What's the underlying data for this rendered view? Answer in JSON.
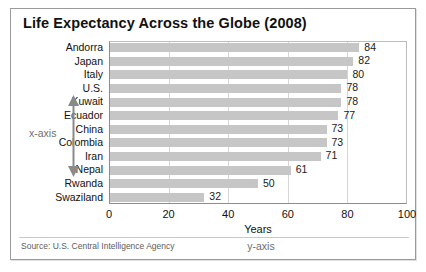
{
  "chart_data": {
    "type": "bar",
    "orientation": "horizontal",
    "title": "Life Expectancy Across the Globe (2008)",
    "categories": [
      "Andorra",
      "Japan",
      "Italy",
      "U.S.",
      "Kuwait",
      "Ecuador",
      "China",
      "Colombia",
      "Iran",
      "Nepal",
      "Rwanda",
      "Swaziland"
    ],
    "values": [
      84,
      82,
      80,
      78,
      78,
      77,
      73,
      73,
      71,
      61,
      50,
      32
    ],
    "xlabel": "Years",
    "ylabel": "",
    "xlim": [
      0,
      100
    ],
    "xticks": [
      0,
      20,
      40,
      60,
      80,
      100
    ],
    "xtick_labels": [
      "0",
      "20",
      "40",
      "60",
      "80",
      "100"
    ],
    "grid": true,
    "grid_axis": "x",
    "legend": false,
    "data_labels": true,
    "bar_color": "#c6c6c6",
    "gridline_color": "#d6d6d6",
    "text_color": "#111111"
  },
  "annotations": {
    "vertical_axis_caption": "x-axis",
    "horizontal_axis_caption": "y-axis",
    "caption_color": "#6e6e6e"
  },
  "footer": {
    "source": "Source: U.S. Central Intelligence Agency"
  }
}
